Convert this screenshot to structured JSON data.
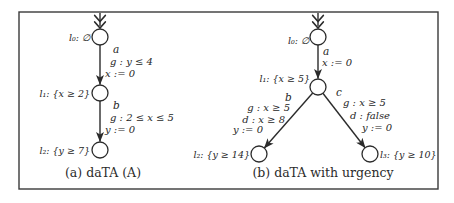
{
  "figure": {
    "background": "#ffffff",
    "border_color": "#3a3a3a",
    "ink_color": "#262626"
  },
  "left_automaton": {
    "caption": "(a) daTA (A)",
    "nodes": {
      "l0": "l₀: ∅",
      "l1": "l₁: {x ≥ 2}",
      "l2": "l₂: {y ≥ 7}"
    },
    "edges": {
      "a": {
        "action": "a",
        "guard": "g : y ≤ 4",
        "reset": "x := 0"
      },
      "b": {
        "action": "b",
        "guard": "g : 2 ≤ x ≤ 5",
        "reset": "y := 0"
      }
    }
  },
  "right_automaton": {
    "caption": "(b) daTA with urgency",
    "nodes": {
      "l0": "l₀: ∅",
      "l1": "l₁: {x ≥ 5}",
      "l2": "l₂: {y ≥ 14}",
      "l3": "l₃: {y ≥ 10}"
    },
    "edges": {
      "a": {
        "action": "a",
        "reset": "x := 0"
      },
      "b": {
        "action": "b",
        "guard": "g : x ≥ 5",
        "deadline": "d : x ≥ 8",
        "reset": "y := 0"
      },
      "c": {
        "action": "c",
        "guard": "g : x ≥ 5",
        "deadline": "d : false",
        "reset": "y := 0"
      }
    }
  }
}
